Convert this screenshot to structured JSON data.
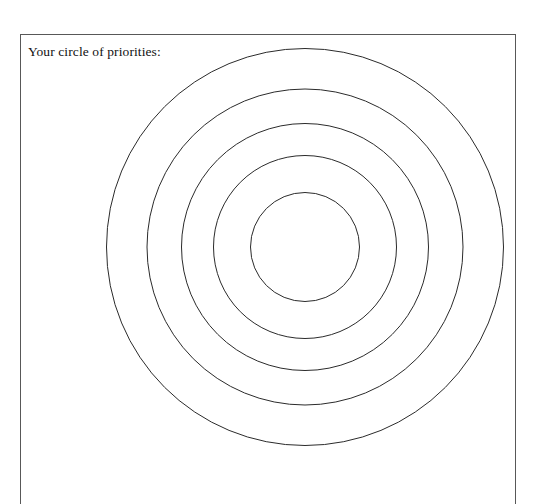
{
  "page": {
    "background_color": "#ffffff",
    "width": 538,
    "height": 448
  },
  "worksheet": {
    "title": "Your circle of priorities:",
    "frame": {
      "border_color": "#585858",
      "left": 20,
      "top": 34,
      "right": 516,
      "bottom_cropped": true
    }
  },
  "chart_data": {
    "type": "scatter",
    "title": "Your circle of priorities:",
    "subtitle": "",
    "xlabel": "",
    "ylabel": "",
    "grid": false,
    "legend": "none",
    "stroke_color": "#2b2b2b",
    "fill_color": "none",
    "stroke_width": 1,
    "center": {
      "x": 305,
      "y": 247
    },
    "ring_count": 5,
    "rings": [
      {
        "index": 1,
        "name": "ring-outer",
        "rx": 198.5,
        "ry": 198.5,
        "label": ""
      },
      {
        "index": 2,
        "name": "ring-second",
        "rx": 158.0,
        "ry": 158.0,
        "label": ""
      },
      {
        "index": 3,
        "name": "ring-third",
        "rx": 123.5,
        "ry": 123.5,
        "label": ""
      },
      {
        "index": 4,
        "name": "ring-fourth",
        "rx": 91.5,
        "ry": 91.5,
        "label": ""
      },
      {
        "index": 5,
        "name": "ring-inner-core",
        "rx": 54.5,
        "ry": 54.5,
        "label": ""
      }
    ]
  }
}
